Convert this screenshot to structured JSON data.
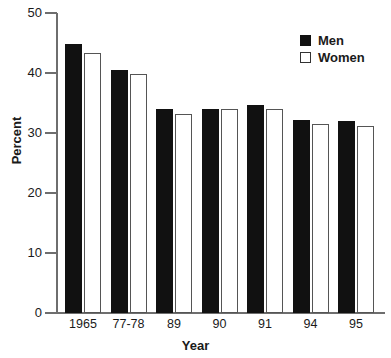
{
  "chart_data": {
    "type": "bar",
    "title": "",
    "xlabel": "Year",
    "ylabel": "Percent",
    "categories": [
      "1965",
      "77-78",
      "89",
      "90",
      "91",
      "94",
      "95"
    ],
    "series": [
      {
        "name": "Men",
        "values": [
          44.8,
          40.5,
          34.0,
          34.0,
          34.7,
          32.2,
          32.0
        ]
      },
      {
        "name": "Women",
        "values": [
          43.4,
          39.9,
          33.2,
          34.0,
          34.0,
          31.5,
          31.2
        ]
      }
    ],
    "ylim": [
      0,
      50
    ],
    "yticks": [
      0,
      10,
      20,
      30,
      40,
      50
    ],
    "ytick_labels": [
      "0",
      "10",
      "20",
      "30",
      "40",
      "50"
    ],
    "grid": false,
    "legend_position": "top-right"
  },
  "legend": {
    "items": [
      {
        "label": "Men",
        "swatch": "filled-square-icon"
      },
      {
        "label": "Women",
        "swatch": "open-square-icon"
      }
    ]
  },
  "colors": {
    "men": "#111111",
    "women": "#ffffff",
    "women_border": "#555555",
    "axis": "#6e6e6e",
    "text": "#1a1a1a",
    "background": "#ffffff"
  }
}
